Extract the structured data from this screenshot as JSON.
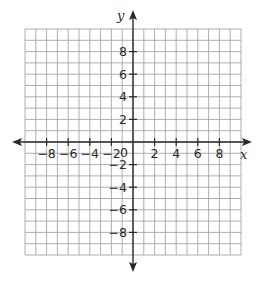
{
  "chart_data": {
    "type": "coordinate-grid",
    "title": "",
    "xlabel": "x",
    "ylabel": "y",
    "xlim": [
      -10,
      10
    ],
    "ylim": [
      -10,
      10
    ],
    "grid": true,
    "grid_step": 1,
    "x_ticks": [
      -8,
      -6,
      -4,
      -2,
      2,
      4,
      6,
      8
    ],
    "y_ticks": [
      8,
      6,
      4,
      2,
      -2,
      -4,
      -6,
      -8
    ],
    "origin_label": "0",
    "series": []
  },
  "labels": {
    "x_axis": "x",
    "y_axis": "y",
    "origin": "0"
  },
  "colors": {
    "grid": "#9a9a9a",
    "axis": "#2a2a2a",
    "text": "#2a2a2a"
  }
}
